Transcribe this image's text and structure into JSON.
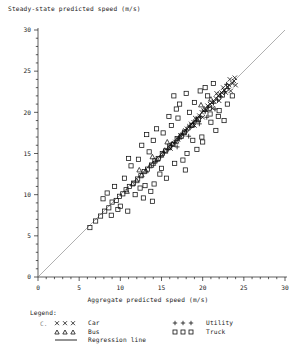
{
  "chart_data": {
    "type": "scatter",
    "title": "",
    "ylabel": "Steady-state predicted speed (m/s)",
    "xlabel": "Aggregate predicted speed (m/s)",
    "xlim": [
      0,
      30
    ],
    "ylim": [
      0,
      30
    ],
    "xticks": [
      0,
      5,
      10,
      15,
      20,
      25,
      30
    ],
    "yticks": [
      0,
      5,
      10,
      15,
      20,
      25,
      30
    ],
    "xticklabels": [
      "0",
      "5",
      "10",
      "15",
      "20",
      "25",
      "30"
    ],
    "yticklabels": [
      "0",
      "5",
      "10",
      "15",
      "20",
      "25",
      "30"
    ],
    "minor_tick_interval": 1,
    "grid": false,
    "legend_position": "below-axes",
    "reference_line": {
      "name": "Regression line",
      "type": "line",
      "x": [
        0,
        30
      ],
      "y": [
        0,
        30
      ],
      "color": "#7a7a7a"
    },
    "series": [
      {
        "name": "Car",
        "marker": "x",
        "color": "#111111",
        "points": [
          [
            16.1,
            15.6
          ],
          [
            16.7,
            16.4
          ],
          [
            17.0,
            16.7
          ],
          [
            17.3,
            17.2
          ],
          [
            17.6,
            17.3
          ],
          [
            17.9,
            17.8
          ],
          [
            18.1,
            18.0
          ],
          [
            18.4,
            18.3
          ],
          [
            18.6,
            18.6
          ],
          [
            18.9,
            18.8
          ],
          [
            19.1,
            19.3
          ],
          [
            19.4,
            19.2
          ],
          [
            19.6,
            19.6
          ],
          [
            19.9,
            20.0
          ],
          [
            20.1,
            20.2
          ],
          [
            20.4,
            20.3
          ],
          [
            20.6,
            20.8
          ],
          [
            20.9,
            21.0
          ],
          [
            21.1,
            21.2
          ],
          [
            21.4,
            21.3
          ],
          [
            21.6,
            21.7
          ],
          [
            21.9,
            22.0
          ],
          [
            22.1,
            22.2
          ],
          [
            22.3,
            22.4
          ],
          [
            22.6,
            22.7
          ],
          [
            22.8,
            22.4
          ],
          [
            23.0,
            23.1
          ],
          [
            23.2,
            23.3
          ],
          [
            23.4,
            22.6
          ],
          [
            23.6,
            23.5
          ],
          [
            23.8,
            23.8
          ],
          [
            24.0,
            23.3
          ],
          [
            22.0,
            21.4
          ],
          [
            21.2,
            20.5
          ],
          [
            20.0,
            19.4
          ],
          [
            19.0,
            18.4
          ],
          [
            23.3,
            24.0
          ],
          [
            23.9,
            24.2
          ],
          [
            22.5,
            23.0
          ],
          [
            21.7,
            22.3
          ]
        ]
      },
      {
        "name": "Bus",
        "marker": "triangle",
        "color": "#111111",
        "points": [
          [
            10.8,
            10.4
          ],
          [
            11.5,
            11.3
          ],
          [
            12.0,
            11.7
          ],
          [
            12.6,
            12.4
          ],
          [
            13.1,
            12.9
          ],
          [
            13.6,
            13.5
          ],
          [
            14.0,
            13.8
          ],
          [
            14.5,
            14.3
          ],
          [
            15.0,
            14.8
          ],
          [
            15.4,
            15.4
          ],
          [
            15.9,
            15.7
          ],
          [
            16.3,
            16.2
          ],
          [
            16.8,
            16.5
          ],
          [
            17.2,
            17.0
          ],
          [
            17.7,
            17.5
          ],
          [
            18.2,
            18.1
          ],
          [
            18.8,
            18.5
          ],
          [
            19.3,
            19.1
          ],
          [
            20.2,
            20.4
          ],
          [
            21.0,
            21.6
          ],
          [
            13.9,
            14.6
          ],
          [
            12.3,
            13.0
          ],
          [
            19.8,
            20.9
          ],
          [
            15.7,
            16.4
          ]
        ]
      },
      {
        "name": "Utility",
        "marker": "plus",
        "color": "#111111",
        "points": [
          [
            14.3,
            14.0
          ],
          [
            14.9,
            14.6
          ],
          [
            15.3,
            15.1
          ],
          [
            15.8,
            15.5
          ],
          [
            16.2,
            16.0
          ],
          [
            16.6,
            16.3
          ],
          [
            17.1,
            16.9
          ],
          [
            17.5,
            17.4
          ],
          [
            18.0,
            17.7
          ],
          [
            18.5,
            18.2
          ],
          [
            18.9,
            18.7
          ],
          [
            19.2,
            19.0
          ],
          [
            19.7,
            19.5
          ],
          [
            20.3,
            20.1
          ],
          [
            20.7,
            20.6
          ],
          [
            21.3,
            21.1
          ],
          [
            21.8,
            21.5
          ],
          [
            22.2,
            21.9
          ],
          [
            22.7,
            22.5
          ],
          [
            23.1,
            22.9
          ],
          [
            20.5,
            19.4
          ],
          [
            18.3,
            17.1
          ],
          [
            16.9,
            15.8
          ],
          [
            19.6,
            18.6
          ],
          [
            21.5,
            20.4
          ],
          [
            22.9,
            23.4
          ]
        ]
      },
      {
        "name": "Truck",
        "marker": "square",
        "color": "#111111",
        "points": [
          [
            6.3,
            6.0
          ],
          [
            7.0,
            6.8
          ],
          [
            7.6,
            7.4
          ],
          [
            8.1,
            8.0
          ],
          [
            8.6,
            8.4
          ],
          [
            9.0,
            9.1
          ],
          [
            9.5,
            9.3
          ],
          [
            9.9,
            9.8
          ],
          [
            10.3,
            10.1
          ],
          [
            10.7,
            10.6
          ],
          [
            11.1,
            11.0
          ],
          [
            11.6,
            11.4
          ],
          [
            12.1,
            11.9
          ],
          [
            12.5,
            12.3
          ],
          [
            12.9,
            12.8
          ],
          [
            13.3,
            13.1
          ],
          [
            13.8,
            13.6
          ],
          [
            14.2,
            14.1
          ],
          [
            14.6,
            14.4
          ],
          [
            15.1,
            15.0
          ],
          [
            15.5,
            15.3
          ],
          [
            16.0,
            15.9
          ],
          [
            16.4,
            16.1
          ],
          [
            16.9,
            16.8
          ],
          [
            17.4,
            17.1
          ],
          [
            17.8,
            17.6
          ],
          [
            18.7,
            18.4
          ],
          [
            19.5,
            19.1
          ],
          [
            20.8,
            20.5
          ],
          [
            22.4,
            22.1
          ],
          [
            8.9,
            7.5
          ],
          [
            10.0,
            8.6
          ],
          [
            10.5,
            12.0
          ],
          [
            11.8,
            10.0
          ],
          [
            12.2,
            14.3
          ],
          [
            13.0,
            11.1
          ],
          [
            13.5,
            15.2
          ],
          [
            14.8,
            12.5
          ],
          [
            15.2,
            17.5
          ],
          [
            16.6,
            13.8
          ],
          [
            17.0,
            19.3
          ],
          [
            18.1,
            15.0
          ],
          [
            19.0,
            21.2
          ],
          [
            20.0,
            16.4
          ],
          [
            20.6,
            22.0
          ],
          [
            21.6,
            17.8
          ],
          [
            11.3,
            13.5
          ],
          [
            12.8,
            9.6
          ],
          [
            14.0,
            16.6
          ],
          [
            15.6,
            12.0
          ],
          [
            17.6,
            14.2
          ],
          [
            18.4,
            20.0
          ],
          [
            19.9,
            17.0
          ],
          [
            21.0,
            18.8
          ],
          [
            9.3,
            11.0
          ],
          [
            10.9,
            8.0
          ],
          [
            13.7,
            10.4
          ],
          [
            16.2,
            18.4
          ],
          [
            7.9,
            9.5
          ],
          [
            14.4,
            18.0
          ],
          [
            22.0,
            20.2
          ],
          [
            18.0,
            22.3
          ],
          [
            15.9,
            19.5
          ],
          [
            12.6,
            16.0
          ],
          [
            11.0,
            14.4
          ],
          [
            19.3,
            15.5
          ],
          [
            21.9,
            19.5
          ],
          [
            17.2,
            21.0
          ],
          [
            13.2,
            17.3
          ],
          [
            20.3,
            23.0
          ],
          [
            8.4,
            10.2
          ],
          [
            23.0,
            21.0
          ],
          [
            22.6,
            19.0
          ],
          [
            16.8,
            20.4
          ],
          [
            14.1,
            11.3
          ],
          [
            15.0,
            13.2
          ],
          [
            18.8,
            16.6
          ],
          [
            20.9,
            19.8
          ],
          [
            19.7,
            22.6
          ],
          [
            9.7,
            8.2
          ],
          [
            12.4,
            10.8
          ],
          [
            13.9,
            9.2
          ],
          [
            16.5,
            22.0
          ],
          [
            17.9,
            13.0
          ],
          [
            21.3,
            23.5
          ],
          [
            23.6,
            22.0
          ]
        ]
      }
    ]
  },
  "legend": {
    "title": "Legend:",
    "c_marker": "C.",
    "entries": [
      {
        "label": "Car",
        "marker": "x",
        "column": "left"
      },
      {
        "label": "Bus",
        "marker": "triangle",
        "column": "left"
      },
      {
        "label": "Utility",
        "marker": "plus",
        "column": "right"
      },
      {
        "label": "Truck",
        "marker": "square",
        "column": "right"
      }
    ],
    "line_entry": {
      "label": "Regression line",
      "marker": "line"
    }
  },
  "colors": {
    "marker": "#111111",
    "line": "#7a7a7a",
    "axis": "#1a1a1a",
    "background": "#ffffff"
  }
}
